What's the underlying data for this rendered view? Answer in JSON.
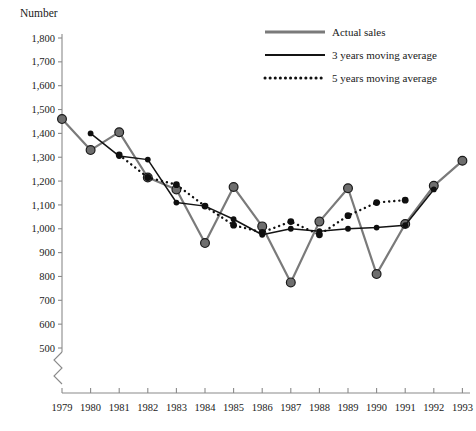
{
  "chart_data": {
    "type": "line",
    "title": "",
    "ylabel": "Number",
    "xlabel": "",
    "ylim": [
      500,
      1800
    ],
    "ytick_step": 100,
    "yticks": [
      "1,800",
      "1,700",
      "1,600",
      "1,500",
      "1,400",
      "1,300",
      "1,200",
      "1,100",
      "1,000",
      "900",
      "800",
      "700",
      "600",
      "500"
    ],
    "ytick_values": [
      1800,
      1700,
      1600,
      1500,
      1400,
      1300,
      1200,
      1100,
      1000,
      900,
      800,
      700,
      600,
      500
    ],
    "axis_break": true,
    "grid": false,
    "legend_position": "top-right",
    "categories": [
      "1979",
      "1980",
      "1981",
      "1982",
      "1983",
      "1984",
      "1985",
      "1986",
      "1987",
      "1988",
      "1989",
      "1990",
      "1991",
      "1992",
      "1993"
    ],
    "x": [
      1979,
      1980,
      1981,
      1982,
      1983,
      1984,
      1985,
      1986,
      1987,
      1988,
      1989,
      1990,
      1991,
      1992,
      1993
    ],
    "series": [
      {
        "name": "Actual sales",
        "style": "solid-thick-gray",
        "values": [
          1460,
          1330,
          1405,
          1215,
          1165,
          940,
          1175,
          1010,
          775,
          1030,
          1170,
          810,
          1020,
          1180,
          1285
        ]
      },
      {
        "name": "3 years moving average",
        "style": "solid-thin-black",
        "values": [
          null,
          1400,
          1305,
          1290,
          1110,
          1095,
          1040,
          975,
          1000,
          990,
          1000,
          1005,
          1015,
          1165,
          null
        ]
      },
      {
        "name": "5 years moving average",
        "style": "dotted-black",
        "values": [
          null,
          null,
          1310,
          1215,
          1185,
          1095,
          1015,
          985,
          1030,
          975,
          1055,
          1110,
          1120,
          null,
          null
        ]
      }
    ]
  },
  "legend": {
    "items": [
      {
        "label": "Actual sales",
        "swatch": "solid-thick-gray"
      },
      {
        "label": "3 years moving average",
        "swatch": "solid-thin-black"
      },
      {
        "label": "5 years moving average",
        "swatch": "dotted-black"
      }
    ]
  },
  "colors": {
    "actual": "#7a7a7a",
    "moving_average": "#141414",
    "axis": "#8a8a8a",
    "text": "#1a1a1a",
    "background": "#ffffff"
  }
}
